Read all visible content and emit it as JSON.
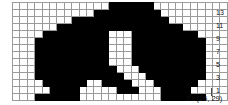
{
  "chart_data": {
    "type": "heatmap",
    "title": "",
    "columns": 29,
    "rows": 14,
    "filled_color": "#000000",
    "empty_color": "#ffffff",
    "grid_line_color": "#9a9a9a",
    "row_labels": [
      "13",
      "11",
      "9",
      "7",
      "5",
      "3",
      "1"
    ],
    "row_label_rows": [
      13,
      11,
      9,
      7,
      5,
      3,
      1
    ],
    "x_caption": "21 (25, 29)",
    "cells": [
      [
        0,
        0,
        0,
        0,
        0,
        0,
        0,
        0,
        0,
        0,
        0,
        0,
        0,
        1,
        1,
        1,
        1,
        1,
        1,
        0,
        0,
        0,
        0,
        0,
        0,
        0,
        0,
        0,
        0
      ],
      [
        0,
        0,
        0,
        0,
        0,
        0,
        0,
        0,
        0,
        0,
        0,
        1,
        1,
        1,
        1,
        1,
        1,
        1,
        1,
        1,
        0,
        0,
        0,
        0,
        0,
        0,
        0,
        0,
        0
      ],
      [
        0,
        0,
        0,
        0,
        0,
        0,
        0,
        0,
        1,
        1,
        1,
        1,
        1,
        1,
        1,
        1,
        1,
        1,
        1,
        1,
        1,
        0,
        0,
        0,
        0,
        0,
        0,
        0,
        0
      ],
      [
        0,
        0,
        0,
        0,
        0,
        0,
        1,
        1,
        1,
        1,
        1,
        1,
        1,
        1,
        1,
        1,
        1,
        1,
        1,
        1,
        1,
        1,
        1,
        0,
        0,
        0,
        0,
        0,
        0
      ],
      [
        0,
        0,
        0,
        0,
        1,
        1,
        1,
        1,
        1,
        1,
        1,
        1,
        1,
        0,
        0,
        0,
        1,
        1,
        1,
        1,
        1,
        1,
        1,
        1,
        1,
        0,
        0,
        0,
        0
      ],
      [
        0,
        0,
        0,
        1,
        1,
        1,
        1,
        1,
        1,
        1,
        1,
        1,
        1,
        0,
        0,
        0,
        1,
        1,
        1,
        1,
        1,
        1,
        1,
        1,
        1,
        1,
        0,
        0,
        0
      ],
      [
        0,
        0,
        0,
        1,
        1,
        1,
        1,
        1,
        1,
        1,
        1,
        1,
        1,
        0,
        0,
        0,
        1,
        1,
        1,
        1,
        1,
        1,
        1,
        1,
        1,
        1,
        0,
        0,
        0
      ],
      [
        0,
        0,
        0,
        1,
        1,
        1,
        1,
        1,
        1,
        1,
        1,
        1,
        1,
        0,
        0,
        0,
        1,
        1,
        1,
        1,
        1,
        1,
        1,
        1,
        1,
        1,
        0,
        0,
        0
      ],
      [
        0,
        0,
        0,
        1,
        1,
        1,
        1,
        1,
        1,
        1,
        1,
        1,
        1,
        0,
        0,
        0,
        1,
        1,
        1,
        1,
        1,
        1,
        1,
        1,
        1,
        1,
        0,
        0,
        0
      ],
      [
        0,
        0,
        0,
        1,
        1,
        1,
        1,
        1,
        1,
        1,
        1,
        1,
        1,
        1,
        0,
        0,
        0,
        1,
        1,
        1,
        1,
        1,
        1,
        1,
        1,
        1,
        0,
        0,
        0
      ],
      [
        0,
        0,
        0,
        1,
        1,
        1,
        1,
        1,
        1,
        1,
        1,
        1,
        1,
        1,
        1,
        0,
        0,
        0,
        1,
        1,
        1,
        1,
        1,
        1,
        1,
        1,
        0,
        0,
        0
      ],
      [
        0,
        0,
        0,
        0,
        1,
        1,
        1,
        1,
        1,
        1,
        0,
        0,
        1,
        1,
        1,
        1,
        0,
        0,
        0,
        1,
        1,
        1,
        1,
        1,
        1,
        0,
        0,
        0,
        0
      ],
      [
        0,
        0,
        0,
        0,
        0,
        1,
        1,
        1,
        1,
        0,
        0,
        0,
        0,
        0,
        1,
        1,
        1,
        0,
        0,
        0,
        1,
        1,
        1,
        1,
        0,
        0,
        0,
        0,
        0
      ],
      [
        0,
        0,
        0,
        1,
        1,
        1,
        1,
        1,
        1,
        0,
        0,
        0,
        0,
        0,
        0,
        0,
        0,
        0,
        0,
        0,
        1,
        1,
        1,
        1,
        1,
        1,
        0,
        0,
        0
      ]
    ]
  }
}
